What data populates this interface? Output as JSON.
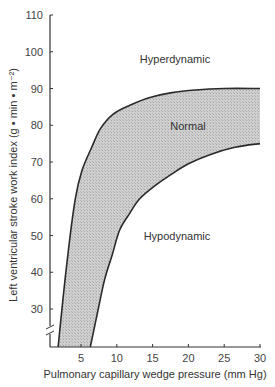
{
  "chart_data": {
    "type": "area",
    "title": "",
    "xlabel": "Pulmonary capillary wedge pressure (mm Hg)",
    "ylabel": "Left ventricular stroke work index (g • min • m⁻²)",
    "xlim": [
      1,
      30
    ],
    "ylim": [
      20,
      110
    ],
    "x_ticks": [
      5,
      10,
      15,
      20,
      25,
      30
    ],
    "y_ticks": [
      30,
      40,
      50,
      60,
      70,
      80,
      90,
      100,
      110
    ],
    "y_axis_break": true,
    "grid": false,
    "legend": null,
    "annotations": [
      {
        "text": "Hyperdynamic",
        "x": 18,
        "y": 96
      },
      {
        "text": "Normal",
        "x": 18.5,
        "y": 82
      },
      {
        "text": "Hypodynamic",
        "x": 18,
        "y": 55
      }
    ],
    "series": [
      {
        "name": "Normal band upper boundary",
        "x": [
          1.8,
          3.0,
          4.2,
          5.2,
          6.5,
          7.7,
          9.5,
          11.9,
          14.5,
          17.5,
          21,
          25,
          30
        ],
        "values": [
          20,
          42,
          60,
          68,
          74,
          79,
          83,
          85.5,
          87.5,
          88.8,
          89.6,
          90,
          90
        ]
      },
      {
        "name": "Normal band lower boundary",
        "x": [
          6.3,
          7.3,
          8.3,
          9.4,
          10.4,
          11.8,
          13.2,
          15.3,
          17.5,
          20,
          23,
          26.5,
          30
        ],
        "values": [
          20,
          29,
          38,
          45,
          51.5,
          56,
          60,
          63.5,
          66.5,
          69.5,
          72,
          74,
          75
        ]
      }
    ],
    "fill": {
      "between": [
        "Normal band upper boundary",
        "Normal band lower boundary"
      ],
      "color": "#c8c8c8"
    }
  }
}
